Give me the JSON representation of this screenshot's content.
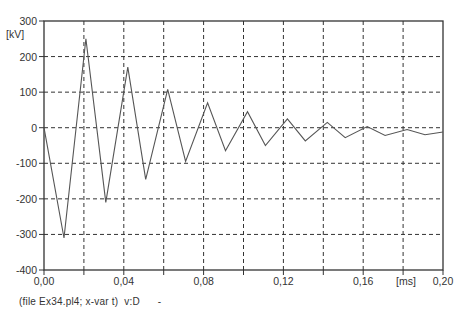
{
  "chart_data": {
    "type": "line",
    "title": "",
    "xlabel": "[ms]",
    "ylabel": "[kV]",
    "xlim": [
      0.0,
      0.2
    ],
    "ylim": [
      -400,
      300
    ],
    "grid": true,
    "x_ticks": [
      0.0,
      0.02,
      0.04,
      0.06,
      0.08,
      0.1,
      0.12,
      0.14,
      0.16,
      0.18,
      0.2
    ],
    "x_tick_labels": [
      "0,00",
      "",
      "0,04",
      "",
      "0,08",
      "",
      "0,12",
      "",
      "0,16",
      "",
      "0,20"
    ],
    "y_ticks": [
      300,
      200,
      100,
      0,
      -100,
      -200,
      -300,
      -400
    ],
    "y_tick_labels": [
      "300",
      "200",
      "100",
      "0",
      "-100",
      "-200",
      "-300",
      "-400"
    ],
    "series": [
      {
        "name": "v:D",
        "color": "#555555",
        "x": [
          0.0,
          0.01,
          0.021,
          0.031,
          0.042,
          0.051,
          0.062,
          0.071,
          0.082,
          0.091,
          0.102,
          0.111,
          0.122,
          0.131,
          0.142,
          0.151,
          0.162,
          0.171,
          0.182,
          0.191,
          0.2
        ],
        "y": [
          0,
          -310,
          250,
          -210,
          170,
          -145,
          108,
          -95,
          70,
          -65,
          45,
          -50,
          25,
          -37,
          15,
          -28,
          3,
          -22,
          -5,
          -20,
          -12
        ]
      }
    ]
  },
  "caption": "(file Ex34.pl4; x-var t)  v:D      -"
}
